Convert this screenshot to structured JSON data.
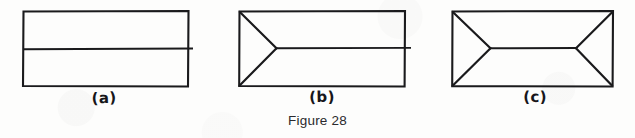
{
  "caption": {
    "text": "Figure 28"
  },
  "colors": {
    "background": "#fdfdfc",
    "ink": "#1a1a1c",
    "caption_text": "#2a2a2d"
  },
  "panels": [
    {
      "id": "a",
      "label": "(a)",
      "description": "rectangle bisected by a horizontal line",
      "rect": {
        "x": 23,
        "y": 11,
        "width": 165,
        "height": 75
      },
      "midline": {
        "x1": 23,
        "y1": 49,
        "x2": 193,
        "y2": 49
      },
      "fins": []
    },
    {
      "id": "b",
      "label": "(b)",
      "description": "rectangle with inward chevron on the left and a horizontal line to the right edge",
      "rect": {
        "x": 239,
        "y": 11,
        "width": 166,
        "height": 75
      },
      "midline": {
        "x1": 276,
        "y1": 48,
        "x2": 411,
        "y2": 48
      },
      "fins": [
        {
          "side": "left",
          "apex_x": 276,
          "apex_y": 48,
          "top_x": 239,
          "top_y": 11,
          "bottom_x": 239,
          "bottom_y": 86
        }
      ]
    },
    {
      "id": "c",
      "label": "(c)",
      "description": "rectangle with inward chevrons on both left and right, joined by a horizontal line",
      "rect": {
        "x": 452,
        "y": 11,
        "width": 161,
        "height": 75
      },
      "midline": {
        "x1": 490,
        "y1": 48,
        "x2": 576,
        "y2": 48
      },
      "fins": [
        {
          "side": "left",
          "apex_x": 490,
          "apex_y": 48,
          "top_x": 452,
          "top_y": 11,
          "bottom_x": 452,
          "bottom_y": 86
        },
        {
          "side": "right",
          "apex_x": 576,
          "apex_y": 48,
          "top_x": 613,
          "top_y": 11,
          "bottom_x": 613,
          "bottom_y": 86
        }
      ]
    }
  ]
}
